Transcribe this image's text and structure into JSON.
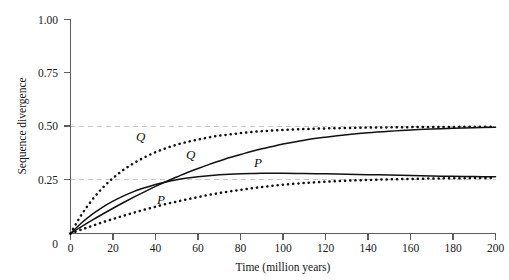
{
  "figure": {
    "background": "#ffffff",
    "axis_color": "#5d5d5d",
    "grid_color": "#c9c9c9",
    "curve_color": "#111111"
  },
  "chart_data": {
    "type": "line",
    "title": "",
    "xlabel": "Time (million years)",
    "ylabel": "Sequence divergence",
    "xlim": [
      0,
      200
    ],
    "ylim": [
      0,
      1.0
    ],
    "xticks": [
      0,
      20,
      40,
      60,
      80,
      100,
      120,
      140,
      160,
      180,
      200
    ],
    "xticklabels": [
      "0",
      "20",
      "40",
      "60",
      "80",
      "100",
      "120",
      "140",
      "160",
      "180",
      "200"
    ],
    "yticks": [
      0,
      0.25,
      0.5,
      0.75,
      1.0
    ],
    "yticklabels": [
      "0",
      "0.25",
      "0.50",
      "0.75",
      "1.00"
    ],
    "grid": "horizontal dashed gridlines at y = 0.25 and y = 0.50 only",
    "gridlines_y": [
      0.25,
      0.5
    ],
    "legend": "inline italic labels on curves",
    "annotations": [
      {
        "text": "Q",
        "x": 27,
        "y": 0.445,
        "style": "italic",
        "note": "upper dotted curve label (left)"
      },
      {
        "text": "Q",
        "x": 55,
        "y": 0.355,
        "style": "italic",
        "note": "upper solid curve label"
      },
      {
        "text": "P",
        "x": 87,
        "y": 0.315,
        "style": "italic",
        "note": "lower solid curve label"
      },
      {
        "text": "P",
        "x": 42,
        "y": 0.165,
        "style": "italic",
        "note": "lower dotted curve label"
      }
    ],
    "x": [
      0,
      5,
      10,
      15,
      20,
      25,
      30,
      35,
      40,
      45,
      50,
      55,
      60,
      65,
      70,
      75,
      80,
      85,
      90,
      95,
      100,
      110,
      120,
      130,
      140,
      150,
      160,
      170,
      180,
      190,
      200
    ],
    "series": [
      {
        "name": "Q dotted",
        "label": "Q",
        "style": "dotted",
        "plateau": 0.5,
        "values": [
          0,
          0.085,
          0.155,
          0.212,
          0.259,
          0.298,
          0.33,
          0.357,
          0.38,
          0.399,
          0.415,
          0.428,
          0.439,
          0.449,
          0.457,
          0.463,
          0.469,
          0.474,
          0.478,
          0.481,
          0.484,
          0.488,
          0.491,
          0.493,
          0.495,
          0.496,
          0.497,
          0.498,
          0.498,
          0.499,
          0.499
        ]
      },
      {
        "name": "Q solid",
        "label": "Q",
        "style": "solid",
        "plateau": 0.5,
        "values": [
          0,
          0.031,
          0.061,
          0.09,
          0.118,
          0.145,
          0.171,
          0.196,
          0.22,
          0.243,
          0.264,
          0.285,
          0.304,
          0.322,
          0.339,
          0.355,
          0.369,
          0.383,
          0.396,
          0.407,
          0.418,
          0.436,
          0.45,
          0.462,
          0.471,
          0.478,
          0.484,
          0.488,
          0.492,
          0.494,
          0.496
        ]
      },
      {
        "name": "P solid",
        "label": "P",
        "style": "solid",
        "plateau": 0.26,
        "values": [
          0,
          0.048,
          0.088,
          0.122,
          0.151,
          0.176,
          0.197,
          0.214,
          0.229,
          0.241,
          0.251,
          0.259,
          0.265,
          0.27,
          0.274,
          0.277,
          0.279,
          0.28,
          0.281,
          0.281,
          0.281,
          0.28,
          0.279,
          0.277,
          0.275,
          0.273,
          0.271,
          0.269,
          0.267,
          0.266,
          0.265
        ]
      },
      {
        "name": "P dotted",
        "label": "P",
        "style": "dotted",
        "plateau": 0.26,
        "values": [
          0,
          0.018,
          0.035,
          0.052,
          0.068,
          0.083,
          0.098,
          0.112,
          0.125,
          0.138,
          0.149,
          0.16,
          0.17,
          0.18,
          0.189,
          0.197,
          0.204,
          0.211,
          0.217,
          0.223,
          0.228,
          0.236,
          0.242,
          0.247,
          0.25,
          0.253,
          0.255,
          0.257,
          0.258,
          0.259,
          0.26
        ]
      }
    ]
  }
}
